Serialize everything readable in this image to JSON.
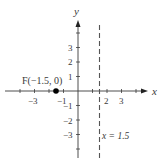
{
  "figure": {
    "axes": {
      "x_label": "x",
      "y_label": "y",
      "x_ticks": [
        {
          "value": -3,
          "label": "−3"
        },
        {
          "value": -1,
          "label": "−1"
        },
        {
          "value": 2,
          "label": "2"
        },
        {
          "value": 3,
          "label": "3"
        }
      ],
      "y_ticks": [
        {
          "value": 3,
          "label": "3"
        },
        {
          "value": 2,
          "label": "2"
        },
        {
          "value": 1,
          "label": "1"
        },
        {
          "value": -1,
          "label": "−1"
        },
        {
          "value": -2,
          "label": "−2"
        },
        {
          "value": -3,
          "label": "−3"
        }
      ]
    },
    "focus_point": {
      "label": "F(−1.5, 0)",
      "x": -1.5,
      "y": 0
    },
    "directrix": {
      "label": "x = 1.5",
      "x": 1.5,
      "style": "dashed"
    },
    "colors": {
      "axis": "#3a3a3a",
      "point": "#000000",
      "directrix": "#555555",
      "background": "#ffffff"
    }
  }
}
